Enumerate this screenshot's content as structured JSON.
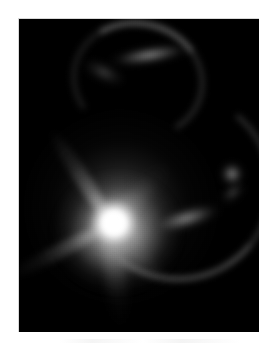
{
  "viewer": {
    "name": "astronomical-image-viewer",
    "background_color": "#ffffff",
    "width": 277,
    "height": 350
  },
  "frame": {
    "name": "sky-frame",
    "background_color": "#000000",
    "border_color": "#d8d8d8",
    "x": 18,
    "y": 18,
    "width": 240,
    "height": 313
  },
  "caption": {
    "text": ""
  },
  "chart_data": {
    "type": "heatmap",
    "title": "",
    "xlabel": "",
    "ylabel": "",
    "colormap": "grayscale",
    "value_range": [
      0,
      255
    ],
    "grid": false,
    "legend": "none",
    "background": "#000000",
    "features": [
      {
        "name": "central-core",
        "kind": "point-source",
        "x": 112,
        "y": 220,
        "peak_value": 255,
        "radius_px": 14,
        "label": "saturated bright nucleus"
      },
      {
        "name": "inner-halo",
        "kind": "diffuse-halo",
        "x": 112,
        "y": 220,
        "peak_value": 200,
        "radius_px": 62,
        "label": "bright inner envelope"
      },
      {
        "name": "outer-halo",
        "kind": "diffuse-halo",
        "x": 112,
        "y": 206,
        "peak_value": 110,
        "radius_px": 110,
        "label": "faint extended halo"
      },
      {
        "name": "spike-upper-left",
        "kind": "radial-spike",
        "angle_deg": -123,
        "length_px": 110,
        "peak_value": 150,
        "label": "upper-left spur"
      },
      {
        "name": "spike-upper-right",
        "kind": "radial-spike",
        "angle_deg": -47,
        "length_px": 84,
        "peak_value": 120,
        "label": "upper-right spur"
      },
      {
        "name": "spike-lower-left",
        "kind": "radial-spike",
        "angle_deg": 153,
        "length_px": 112,
        "peak_value": 135,
        "label": "lower-left spur"
      },
      {
        "name": "spike-lower",
        "kind": "radial-spike",
        "angle_deg": 84,
        "length_px": 96,
        "peak_value": 105,
        "label": "downward plume"
      },
      {
        "name": "spike-lower-right",
        "kind": "radial-spike",
        "angle_deg": 46,
        "length_px": 74,
        "peak_value": 95,
        "label": "lower-right spur"
      },
      {
        "name": "lensed-arc-top",
        "kind": "arc",
        "x": 132,
        "y": 48,
        "span_px": 110,
        "peak_value": 135,
        "label": "curved arc above the nucleus"
      },
      {
        "name": "lensed-arc-right",
        "kind": "arc",
        "x": 182,
        "y": 200,
        "span_px": 130,
        "peak_value": 145,
        "label": "long curved tail toward the right"
      },
      {
        "name": "compact-companion",
        "kind": "point-source",
        "x": 231,
        "y": 173,
        "peak_value": 115,
        "radius_px": 9,
        "label": "faint compact companion object"
      }
    ]
  }
}
